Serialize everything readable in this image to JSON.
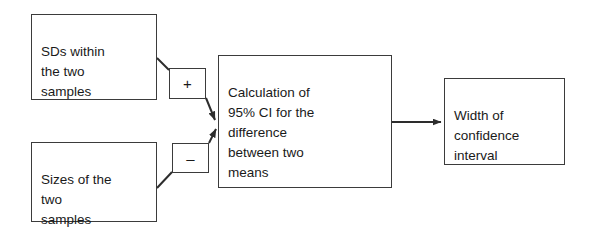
{
  "diagram": {
    "type": "flowchart",
    "background_color": "#ffffff",
    "line_color": "#3b3b3b",
    "text_color": "#1a1a1a",
    "nodes": [
      {
        "id": "sds",
        "label": "SDs within\nthe two\nsamples",
        "shape": "rectangle",
        "x": 31,
        "y": 14,
        "w": 126,
        "h": 86
      },
      {
        "id": "sizes",
        "label": "Sizes of the\ntwo\nsamples",
        "shape": "rectangle",
        "x": 31,
        "y": 142,
        "w": 126,
        "h": 80
      },
      {
        "id": "calculation",
        "label": "Calculation of\n95% CI for the\ndifference\nbetween two\nmeans",
        "shape": "rectangle",
        "x": 218,
        "y": 55,
        "w": 174,
        "h": 133
      },
      {
        "id": "width",
        "label": "Width of\nconfidence\ninterval",
        "shape": "rectangle",
        "x": 444,
        "y": 78,
        "w": 121,
        "h": 87
      }
    ],
    "operators": [
      {
        "id": "plus",
        "symbol": "+",
        "name": "plus-operator",
        "x": 169,
        "y": 68,
        "w": 37,
        "h": 31
      },
      {
        "id": "minus",
        "symbol": "–",
        "name": "minus-operator",
        "x": 172,
        "y": 143,
        "w": 37,
        "h": 30
      }
    ],
    "edges": [
      {
        "id": "sds-to-plus",
        "from": "sds",
        "to": "plus",
        "arrow": false
      },
      {
        "id": "plus-to-calculation",
        "from": "plus",
        "to": "calculation",
        "arrow": true
      },
      {
        "id": "sizes-to-minus",
        "from": "sizes",
        "to": "minus",
        "arrow": false
      },
      {
        "id": "minus-to-calculation",
        "from": "minus",
        "to": "calculation",
        "arrow": true
      },
      {
        "id": "calculation-to-width",
        "from": "calculation",
        "to": "width",
        "arrow": true
      }
    ]
  }
}
